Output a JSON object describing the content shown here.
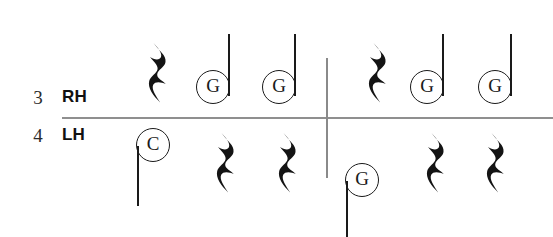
{
  "notation": {
    "time_signature": {
      "numerator": "3",
      "denominator": "4"
    },
    "staves": [
      {
        "name": "right-hand",
        "label": "RH",
        "measures": [
          {
            "index": 1,
            "events": [
              {
                "type": "rest",
                "value": "quarter",
                "x": 146,
                "y": 40
              },
              {
                "type": "note",
                "pitch": "G",
                "value": "quarter",
                "stem": "up",
                "x": 196,
                "y": 70,
                "stem_length": 62
              },
              {
                "type": "note",
                "pitch": "G",
                "value": "quarter",
                "stem": "up",
                "x": 262,
                "y": 70,
                "stem_length": 62
              }
            ]
          },
          {
            "index": 2,
            "events": [
              {
                "type": "rest",
                "value": "quarter",
                "x": 366,
                "y": 40
              },
              {
                "type": "note",
                "pitch": "G",
                "value": "quarter",
                "stem": "up",
                "x": 410,
                "y": 70,
                "stem_length": 62
              },
              {
                "type": "note",
                "pitch": "G",
                "value": "quarter",
                "stem": "up",
                "x": 478,
                "y": 70,
                "stem_length": 62
              }
            ]
          }
        ]
      },
      {
        "name": "left-hand",
        "label": "LH",
        "measures": [
          {
            "index": 1,
            "events": [
              {
                "type": "note",
                "pitch": "C",
                "value": "quarter",
                "stem": "down",
                "x": 136,
                "y": 128,
                "stem_length": 60
              },
              {
                "type": "rest",
                "value": "quarter",
                "x": 214,
                "y": 130
              },
              {
                "type": "rest",
                "value": "quarter",
                "x": 276,
                "y": 130
              }
            ]
          },
          {
            "index": 2,
            "events": [
              {
                "type": "note",
                "pitch": "G",
                "value": "quarter",
                "stem": "down",
                "x": 345,
                "y": 163,
                "stem_length": 56
              },
              {
                "type": "rest",
                "value": "quarter",
                "x": 424,
                "y": 130
              },
              {
                "type": "rest",
                "value": "quarter",
                "x": 484,
                "y": 130
              }
            ]
          }
        ]
      }
    ]
  },
  "colors": {
    "ink": "#1a1a1a",
    "staff_line": "#8f8f8f",
    "barline": "#8a8a8a",
    "background": "#ffffff"
  }
}
